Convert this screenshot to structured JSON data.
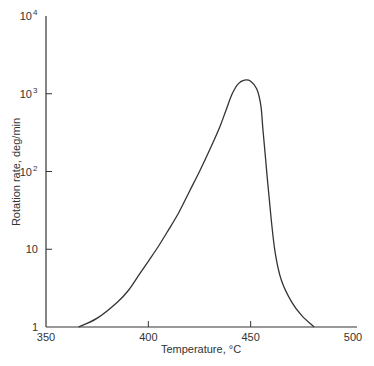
{
  "chart_data": {
    "type": "line",
    "title": "",
    "xlabel": "Temperature, °C",
    "ylabel": "Rotation rate, deg/min",
    "xlim": [
      350,
      500
    ],
    "ylim": [
      1,
      10000
    ],
    "yscale": "log",
    "grid": false,
    "legend": null,
    "x_ticks": [
      "350",
      "400",
      "450",
      "500"
    ],
    "y_ticks": [
      "1",
      "10",
      "10²",
      "10³",
      "10⁴"
    ],
    "series": [
      {
        "name": "Rotation rate",
        "x": [
          366,
          375,
          385,
          390,
          395,
          400,
          405,
          410,
          415,
          420,
          425,
          430,
          435,
          438,
          441,
          444,
          447,
          450,
          453,
          455,
          456,
          458,
          460,
          462,
          465,
          470,
          475,
          481
        ],
        "y": [
          1,
          1.3,
          2.1,
          2.9,
          4.5,
          7,
          11,
          18,
          30,
          55,
          100,
          190,
          380,
          620,
          1000,
          1350,
          1500,
          1450,
          1150,
          700,
          350,
          90,
          25,
          9,
          4,
          2.1,
          1.4,
          1
        ]
      }
    ]
  },
  "axes": {
    "x_tick_labels": [
      "350",
      "400",
      "450",
      "500"
    ],
    "y_tick_labels": [
      {
        "base": "1",
        "exp": ""
      },
      {
        "base": "10",
        "exp": ""
      },
      {
        "base": "10",
        "exp": "2"
      },
      {
        "base": "10",
        "exp": "3"
      },
      {
        "base": "10",
        "exp": "4"
      }
    ],
    "xlabel": "Temperature, °C",
    "ylabel": "Rotation rate, deg/min"
  },
  "colors": {
    "line": "#333333",
    "axis": "#333333"
  }
}
